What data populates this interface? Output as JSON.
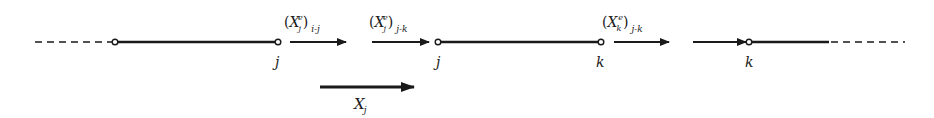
{
  "diagram": {
    "color": "#1a1a1a",
    "segments": [
      {
        "from": "",
        "to": "j",
        "style": "dashed-then-solid"
      },
      {
        "from": "j",
        "to": "k",
        "style": "solid"
      },
      {
        "from": "k",
        "to": "",
        "style": "solid-then-dashed"
      }
    ],
    "node_labels": [
      "j",
      "j",
      "k",
      "k"
    ],
    "arrows": [
      {
        "base": "X",
        "sub": "j",
        "sup": "e",
        "outer_sub": "i-j"
      },
      {
        "base": "X",
        "sub": "j",
        "sup": "e",
        "outer_sub": "j-k"
      },
      {
        "base": "X",
        "sub": "k",
        "sup": "e",
        "outer_sub": "j-k"
      },
      {
        "base": "",
        "sub": "",
        "sup": "",
        "outer_sub": ""
      }
    ],
    "resultant": {
      "base": "X",
      "sub": "j"
    }
  }
}
